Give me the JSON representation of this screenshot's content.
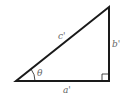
{
  "diagram": {
    "labels": {
      "hypotenuse": "c'",
      "opposite": "b'",
      "adjacent": "a'",
      "angle": "θ"
    },
    "vertices": {
      "left": [
        16,
        81
      ],
      "right_angle": [
        109,
        81
      ],
      "top": [
        109,
        7
      ]
    },
    "colors": {
      "stroke": "#1a1a1a",
      "label": "#666666",
      "background": "#ffffff"
    }
  }
}
